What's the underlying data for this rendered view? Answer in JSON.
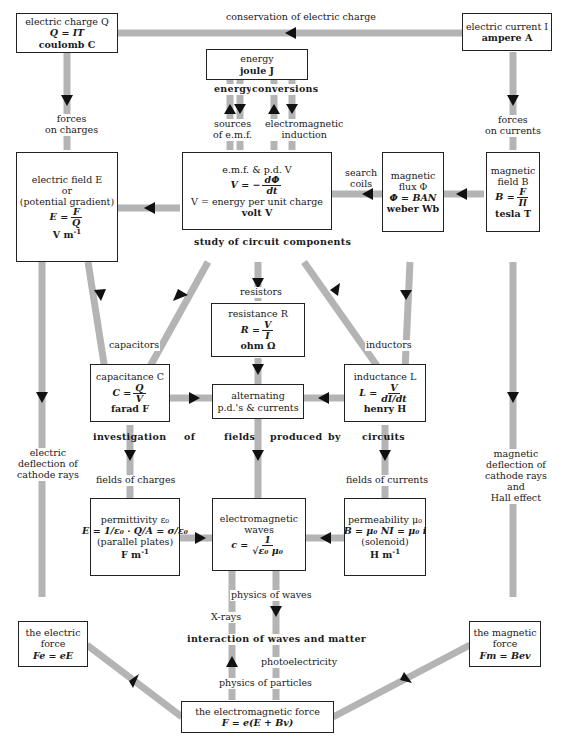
{
  "diagram": {
    "boxes": {
      "charge": {
        "name": "electric charge Q",
        "formula": "Q = IT",
        "unit": "coulomb C"
      },
      "current": {
        "name": "electric current I",
        "unit": "ampere A"
      },
      "energy": {
        "name": "energy",
        "unit": "joule J"
      },
      "field": {
        "name": "electric field E",
        "or": "or",
        "alt": "(potential gradient)",
        "formula_lhs": "E =",
        "num": "F",
        "den": "Q",
        "unit": "V m",
        "unit_exp": "-1"
      },
      "emf": {
        "name": "e.m.f. & p.d. V",
        "formula_lhs": "V = −",
        "num": "dΦ",
        "den": "dt",
        "def": "V = energy per unit charge",
        "unit": "volt V"
      },
      "flux": {
        "line1": "magnetic",
        "line2": "flux Φ",
        "formula": "Φ = BAN",
        "unit": "weber Wb"
      },
      "bfield": {
        "line1": "magnetic",
        "line2": "field B",
        "formula_lhs": "B =",
        "num": "F",
        "den": "Il",
        "unit": "tesla T"
      },
      "resistance": {
        "name": "resistance R",
        "formula_lhs": "R =",
        "num": "V",
        "den": "I",
        "unit": "ohm Ω"
      },
      "capacitance": {
        "name": "capacitance C",
        "formula_lhs": "C =",
        "num": "Q",
        "den": "V",
        "unit": "farad F"
      },
      "ac": {
        "line1": "alternating",
        "line2": "p.d.'s & currents"
      },
      "inductance": {
        "name": "inductance L",
        "formula_lhs": "L =",
        "num": "V",
        "den": "dI/dt",
        "unit": "henry H"
      },
      "permittivity": {
        "name": "permittivity ε₀",
        "formula": "E = 1/ε₀ · Q/A = σ/ε₀",
        "note": "(parallel plates)",
        "unit": "F m",
        "unit_exp": "-1"
      },
      "emwaves": {
        "line1": "electromagnetic",
        "line2": "waves",
        "formula_lhs": "c =",
        "num": "1",
        "den": "√ε₀ μ₀"
      },
      "permeability": {
        "name": "permeability μ₀",
        "formula": "B = μ₀ NI = μ₀ i",
        "note": "(solenoid)",
        "unit": "H m",
        "unit_exp": "-1"
      },
      "eforce": {
        "line1": "the electric",
        "line2": "force",
        "formula": "Fe = eE"
      },
      "mforce": {
        "line1": "the magnetic",
        "line2": "force",
        "formula": "Fm = Bev"
      },
      "emforce": {
        "name": "the electromagnetic force",
        "formula": "F = e(E + Bv)"
      }
    },
    "labels": {
      "conservation": "conservation of electric charge",
      "forces_charges_1": "forces",
      "forces_charges_2": "on charges",
      "forces_currents_1": "forces",
      "forces_currents_2": "on currents",
      "energy_conversions_a": "energy",
      "energy_conversions_b": "conversions",
      "sources_1": "sources",
      "sources_2": "of e.m.f.",
      "induction_1": "electromagnetic",
      "induction_2": "induction",
      "search_1": "search",
      "search_2": "coils",
      "study": "study of circuit components",
      "resistors": "resistors",
      "capacitors": "capacitors",
      "inductors": "inductors",
      "investigation": [
        "investigation",
        "of",
        "fields",
        "produced",
        "by",
        "circuits"
      ],
      "fields_charges": "fields of charges",
      "fields_currents": "fields of currents",
      "edeflect_1": "electric",
      "edeflect_2": "deflection of",
      "edeflect_3": "cathode rays",
      "mdeflect_1": "magnetic",
      "mdeflect_2": "deflection of",
      "mdeflect_3": "cathode rays",
      "mdeflect_4": "and",
      "mdeflect_5": "Hall effect",
      "physics_waves": "physics of waves",
      "xrays": "X-rays",
      "interaction": "interaction of waves and matter",
      "photoelectricity": "photoelectricity",
      "physics_particles": "physics of particles"
    },
    "colors": {
      "bar": "#b4b4b4",
      "arrow": "#111111",
      "border": "#222222"
    }
  }
}
